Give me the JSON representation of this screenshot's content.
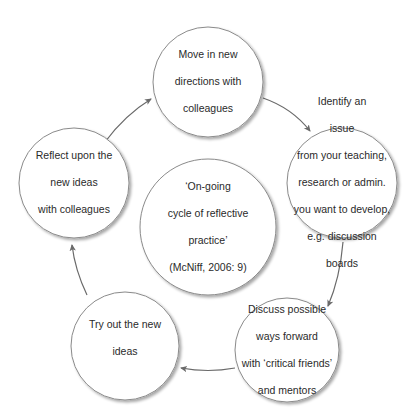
{
  "diagram": {
    "type": "cycle",
    "colors": {
      "stroke": "#8a8a8a",
      "arrow": "#6a6a6a",
      "text": "#2a2a2a",
      "shadow": "#d4d4d4"
    },
    "center": {
      "lines": [
        "‘On-going",
        "cycle of reflective",
        "practice’",
        "(McNiff, 2006: 9)"
      ]
    },
    "nodes": [
      {
        "id": "move",
        "lines": [
          "Move in new",
          "directions with",
          "colleagues"
        ]
      },
      {
        "id": "identify",
        "lines": [
          "Identify an",
          "issue",
          "from your teaching,",
          "research or admin.",
          "you want to develop,",
          "e.g. discussion",
          "boards"
        ]
      },
      {
        "id": "discuss",
        "lines": [
          "Discuss possible",
          "ways forward",
          "with ‘critical friends’",
          "and mentors"
        ]
      },
      {
        "id": "try",
        "lines": [
          "Try out the new",
          "ideas"
        ]
      },
      {
        "id": "reflect",
        "lines": [
          "Reflect upon the",
          "new ideas",
          "with colleagues"
        ]
      }
    ],
    "edges": [
      {
        "from": "move",
        "to": "identify"
      },
      {
        "from": "identify",
        "to": "discuss"
      },
      {
        "from": "discuss",
        "to": "try"
      },
      {
        "from": "try",
        "to": "reflect"
      },
      {
        "from": "reflect",
        "to": "move"
      }
    ]
  }
}
